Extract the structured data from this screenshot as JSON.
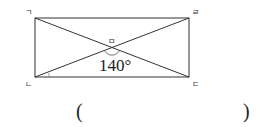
{
  "figure": {
    "type": "rectangle-with-diagonals",
    "vertices": {
      "top_left": "ㄱ",
      "bottom_left": "ㄴ",
      "bottom_right": "ㄷ",
      "top_right": "ㄹ",
      "intersection": "ㅁ"
    },
    "angle_label": "140°",
    "line_color": "#333333"
  },
  "answer": {
    "open_paren": "(",
    "close_paren": ")",
    "value": ""
  }
}
